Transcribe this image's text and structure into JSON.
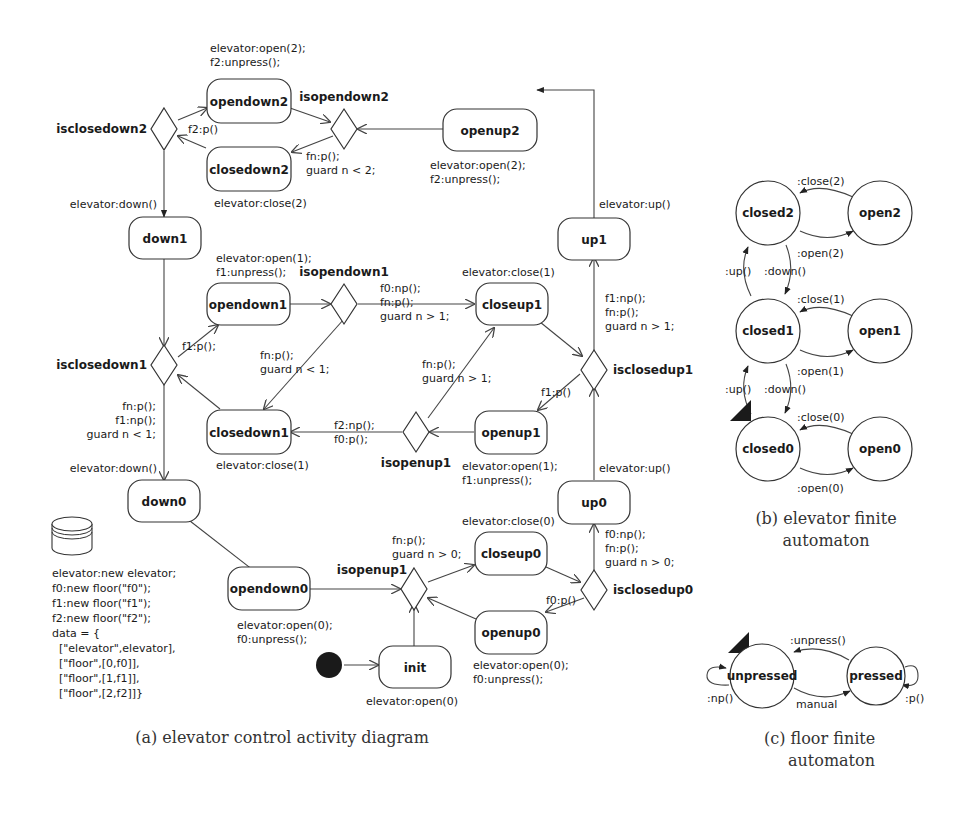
{
  "activity_diagram": {
    "caption": "(a) elevator control activity diagram",
    "states": {
      "opendown2": "opendown2",
      "closedown2": "closedown2",
      "openup2": "openup2",
      "down1": "down1",
      "up1": "up1",
      "opendown1": "opendown1",
      "closeup1": "closeup1",
      "closedown1": "closedown1",
      "openup1": "openup1",
      "down0": "down0",
      "up0": "up0",
      "opendown0": "opendown0",
      "closeup0": "closeup0",
      "openup0": "openup0",
      "init": "init"
    },
    "decisions": {
      "isclosedown2": "isclosedown2",
      "isopendown2": "isopendown2",
      "isopendown1": "isopendown1",
      "isclosedown1": "isclosedown1",
      "isclosedup1": "isclosedup1",
      "isopenup1": "isopenup1",
      "isopenup0": "isopenup1",
      "isclosedup0": "isclosedup0"
    },
    "actions": {
      "opendown2": [
        "elevator:open(2);",
        "f2:unpress();"
      ],
      "closedown2": [
        "elevator:close(2)"
      ],
      "openup2": [
        "elevator:open(2);",
        "f2:unpress();"
      ],
      "opendown1": [
        "elevator:open(1);",
        "f1:unpress();"
      ],
      "closeup1": [
        "elevator:close(1)"
      ],
      "closedown1": [
        "elevator:close(1)"
      ],
      "openup1": [
        "elevator:open(1);",
        "f1:unpress();"
      ],
      "opendown0": [
        "elevator:open(0);",
        "f0:unpress();"
      ],
      "closeup0": [
        "elevator:close(0)"
      ],
      "openup0": [
        "elevator:open(0);",
        "f0:unpress();"
      ],
      "init": [
        "elevator:open(0)"
      ]
    },
    "guards": {
      "f2_p": [
        "f2:p()"
      ],
      "isopendown2_out": [
        "fn:p();",
        "guard n < 2;"
      ],
      "down_2_1": [
        "elevator:down()"
      ],
      "up_1_2": [
        "elevator:up()"
      ],
      "f1_p_down": [
        "f1:p();"
      ],
      "isopendown1_up": [
        "f0:np();",
        "fn:p();",
        "guard n > 1;"
      ],
      "isopendown1_down": [
        "fn:p();",
        "guard n < 1;"
      ],
      "isclosedown1_down": [
        "fn:p();",
        "f1:np();",
        "guard n < 1;"
      ],
      "down_1_0": [
        "elevator:down()"
      ],
      "isclosedup1_up": [
        "f1:np();",
        "fn:p();",
        "guard n > 1;"
      ],
      "f1_p_up": [
        "f1:p()"
      ],
      "isopenup1_up": [
        "fn:p();",
        "guard n > 1;"
      ],
      "isopenup1_down": [
        "f2:np();",
        "f0:p();"
      ],
      "up_0_1": [
        "elevator:up()"
      ],
      "isopenup0_up": [
        "fn:p();",
        "guard n > 0;"
      ],
      "isclosedup0_up": [
        "f0:np();",
        "fn:p();",
        "guard n > 0;"
      ],
      "f0_p_up": [
        "f0:p()"
      ]
    },
    "data_store": [
      "elevator:new elevator;",
      "f0:new floor(\"f0\");",
      "f1:new floor(\"f1\");",
      "f2:new floor(\"f2\");",
      "data = {",
      "  [\"elevator\",elevator],",
      "  [\"floor\",[0,f0]],",
      "  [\"floor\",[1,f1]],",
      "  [\"floor\",[2,f2]]}"
    ]
  },
  "elevator_fa": {
    "caption_line1": "(b) elevator finite",
    "caption_line2": "automaton",
    "states": {
      "closed2": "closed2",
      "open2": "open2",
      "closed1": "closed1",
      "open1": "open1",
      "closed0": "closed0",
      "open0": "open0"
    },
    "transitions": {
      "close2": ":close(2)",
      "open2": ":open(2)",
      "close1": ":close(1)",
      "open1": ":open(1)",
      "close0": ":close(0)",
      "open0": ":open(0)",
      "up21": ":up()",
      "down21": ":down()",
      "up10": ":up()",
      "down10": ":down()"
    }
  },
  "floor_fa": {
    "caption_line1": "(c) floor finite",
    "caption_line2": "automaton",
    "states": {
      "unpressed": "unpressed",
      "pressed": "pressed"
    },
    "transitions": {
      "unpress": ":unpress()",
      "manual": "manual",
      "np": ":np()",
      "p": ":p()"
    }
  }
}
